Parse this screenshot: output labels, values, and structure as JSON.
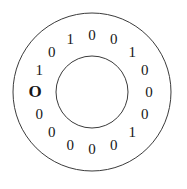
{
  "figure": {
    "kind": "absolute-rotary-encoder-disc",
    "stroke_color": "#3b3b3b",
    "text_color": "#171717",
    "background_color": "#ffffff"
  },
  "geometry": {
    "center_x": 92,
    "center_y": 92,
    "outer_radius": 79,
    "inner_radius": 36,
    "label_radius": 57,
    "start_angle_deg": 180,
    "angle_step_deg": 22.5,
    "direction": "clockwise"
  },
  "ring": {
    "bit_count": 16,
    "origin_label": "O",
    "sequence": "0101001000010000",
    "bits": [
      {
        "index": 0,
        "label": "O",
        "angle": 180.0,
        "origin": true
      },
      {
        "index": 1,
        "label": "1",
        "angle": 202.5,
        "origin": false
      },
      {
        "index": 2,
        "label": "0",
        "angle": 225.0,
        "origin": false
      },
      {
        "index": 3,
        "label": "1",
        "angle": 247.5,
        "origin": false
      },
      {
        "index": 4,
        "label": "0",
        "angle": 270.0,
        "origin": false
      },
      {
        "index": 5,
        "label": "0",
        "angle": 292.5,
        "origin": false
      },
      {
        "index": 6,
        "label": "1",
        "angle": 315.0,
        "origin": false
      },
      {
        "index": 7,
        "label": "0",
        "angle": 337.5,
        "origin": false
      },
      {
        "index": 8,
        "label": "0",
        "angle": 0.0,
        "origin": false
      },
      {
        "index": 9,
        "label": "0",
        "angle": 22.5,
        "origin": false
      },
      {
        "index": 10,
        "label": "1",
        "angle": 45.0,
        "origin": false
      },
      {
        "index": 11,
        "label": "0",
        "angle": 67.5,
        "origin": false
      },
      {
        "index": 12,
        "label": "0",
        "angle": 90.0,
        "origin": false
      },
      {
        "index": 13,
        "label": "0",
        "angle": 112.5,
        "origin": false
      },
      {
        "index": 14,
        "label": "0",
        "angle": 135.0,
        "origin": false
      },
      {
        "index": 15,
        "label": "0",
        "angle": 157.5,
        "origin": false
      }
    ]
  }
}
